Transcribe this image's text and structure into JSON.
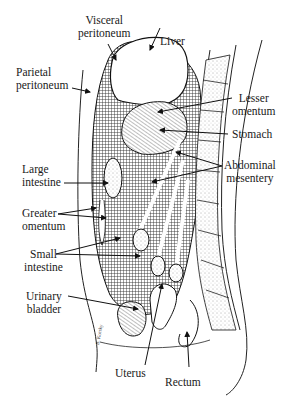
{
  "figure": {
    "signature": "B. Korsky",
    "labels": {
      "visceral_peritoneum": [
        "Visceral",
        "peritoneum"
      ],
      "liver": [
        "Liver"
      ],
      "parietal_peritoneum": [
        "Parietal",
        "peritoneum"
      ],
      "lesser_omentum": [
        "Lesser",
        "omentum"
      ],
      "stomach": [
        "Stomach"
      ],
      "large_intestine": [
        "Large",
        "intestine"
      ],
      "abdominal_mesentery": [
        "Abdominal",
        "mesentery"
      ],
      "greater_omentum": [
        "Greater",
        "omentum"
      ],
      "small_intestine": [
        "Small",
        "intestine"
      ],
      "urinary_bladder": [
        "Urinary",
        "bladder"
      ],
      "uterus": [
        "Uterus"
      ],
      "rectum": [
        "Rectum"
      ]
    },
    "colors": {
      "ink": "#1a1a1a",
      "background": "#ffffff",
      "crosshatch": "#555555"
    }
  }
}
